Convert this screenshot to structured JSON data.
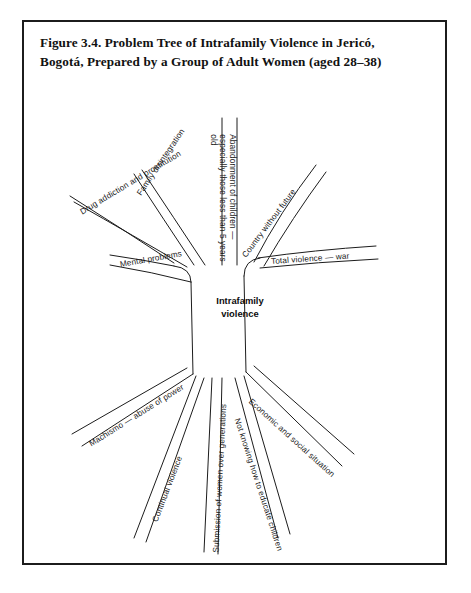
{
  "figure": {
    "title_line1": "Figure 3.4. Problem Tree of Intrafamily Violence in Jericó,",
    "title_line2": "Bogotá, Prepared by a Group of Adult Women (aged 28–38)",
    "center_line1": "Intrafamily",
    "center_line2": "violence",
    "stroke_color": "#1c1c1c",
    "background_color": "#ffffff"
  },
  "diagram_data": {
    "type": "problem-tree",
    "core_problem": "Intrafamily violence",
    "effects_label": "Branches (effects)",
    "causes_label": "Roots (causes)",
    "branches": [
      {
        "id": "branch-mental-problems",
        "label": "Mental problems",
        "angle": -22,
        "x": 96,
        "y": 238
      },
      {
        "id": "branch-drug-addiction-prostitution",
        "label": "Drug addiction and prostitution",
        "angle": -37,
        "x": 57,
        "y": 186
      },
      {
        "id": "branch-family-disintegration",
        "label": "Family disintegration",
        "angle": -57,
        "x": 112,
        "y": 163
      },
      {
        "id": "branch-abandonment-of-children",
        "label": "Abandonment of children — especially those less than 5 years old",
        "angle": -90,
        "x": 209,
        "y": 100
      },
      {
        "id": "branch-country-without-future",
        "label": "Country without future",
        "angle": -55,
        "x": 238,
        "y": 228
      },
      {
        "id": "branch-total-violence-war",
        "label": "Total violence — war",
        "angle": -7,
        "x": 247,
        "y": 239
      }
    ],
    "roots": [
      {
        "id": "root-machismo-abuse-of-power",
        "label": "Machismo — abuse of power",
        "angle": 24,
        "x": 83,
        "y": 419
      },
      {
        "id": "root-continual-violence",
        "label": "Continual violence",
        "angle": 62,
        "x": 152,
        "y": 428
      },
      {
        "id": "root-submission-of-women",
        "label": "Submission of women over generations",
        "angle": 84,
        "x": 213,
        "y": 389
      },
      {
        "id": "root-not-knowing-how-to-educate-children",
        "label": "Not knowing how to educate children",
        "angle": 66,
        "x": 234,
        "y": 396
      },
      {
        "id": "root-economic-and-social-situation",
        "label": "Economic and social situation",
        "angle": 38,
        "x": 245,
        "y": 381
      }
    ]
  }
}
